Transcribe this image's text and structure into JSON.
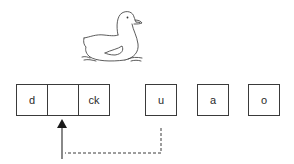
{
  "picture": {
    "subject": "duck",
    "icon": "duck-illustration"
  },
  "word": {
    "cells": [
      {
        "text": "d"
      },
      {
        "text": ""
      },
      {
        "text": "ck"
      }
    ],
    "missing_index": 1
  },
  "choices": [
    {
      "text": "u"
    },
    {
      "text": "a"
    },
    {
      "text": "o"
    }
  ],
  "connector": {
    "from": "u",
    "to": "blank-cell",
    "style": "dashed",
    "arrow": "solid-up"
  },
  "colors": {
    "stroke": "#3a3a3a",
    "text": "#2a2a2a",
    "background": "#ffffff"
  }
}
